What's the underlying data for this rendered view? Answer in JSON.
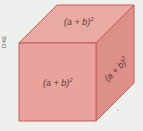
{
  "figure": {
    "side_label": "D4E",
    "faces": {
      "top": {
        "label": "(a + b)",
        "exponent": "2"
      },
      "front": {
        "label": "(a + b)",
        "exponent": "2"
      },
      "right": {
        "label": "(a + b)",
        "exponent": "2"
      }
    },
    "colors": {
      "top": "#e8a9a1",
      "front": "#e9a29b",
      "right": "#dc8f88",
      "edge": "#c85a52",
      "background": "#eef0ee"
    }
  }
}
